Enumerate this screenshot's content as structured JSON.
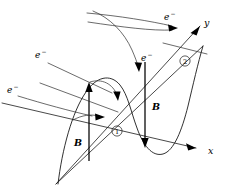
{
  "figure": {
    "type": "physics-vector-diagram",
    "background_color": "#ffffff",
    "stroke_color": "#1a1a1a",
    "width": 228,
    "height": 194
  },
  "axes": {
    "x_label": "x",
    "y_label": "y",
    "description": "Three-dimensional Cartesian axes drawn in oblique projection; x to lower right, y to upper right, z toward lower left"
  },
  "markers": [
    {
      "id": "position-1",
      "label": "1"
    },
    {
      "id": "position-2",
      "label": "2"
    }
  ],
  "field_vectors": [
    {
      "id": "B-left",
      "label": "B",
      "direction": "up",
      "at_marker": "1"
    },
    {
      "id": "B-right",
      "label": "B",
      "direction": "down",
      "at_marker": "2"
    }
  ],
  "electrons": [
    {
      "id": "electron-top-right",
      "label": "e",
      "charge": "−"
    },
    {
      "id": "electron-middle",
      "label": "e",
      "charge": "−"
    },
    {
      "id": "electron-upper-left",
      "label": "e",
      "charge": "−"
    },
    {
      "id": "electron-lower-left",
      "label": "e",
      "charge": "−"
    }
  ],
  "wave": {
    "id": "sinusoidal-field-wave",
    "description": "Sine-shaped magnetic field line crossing the x axis at marker 1"
  }
}
